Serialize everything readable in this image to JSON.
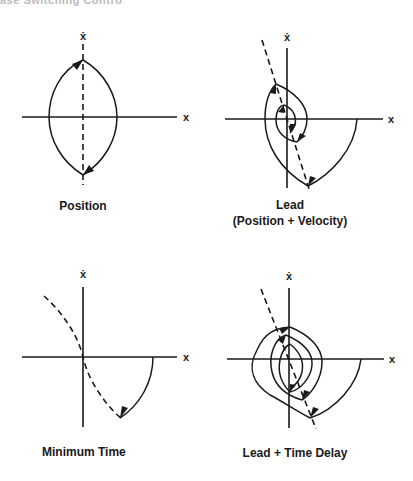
{
  "header": {
    "cut_text": "ase Switching Contro"
  },
  "panels": [
    {
      "id": "position",
      "title": "Position",
      "x_label": "x",
      "y_label": "ẋ",
      "switching_line": "vertical dashed (x = 0)"
    },
    {
      "id": "lead",
      "title": "Lead",
      "subtitle": "(Position + Velocity)",
      "x_label": "x",
      "y_label": "ẋ",
      "switching_line": "tilted dashed line"
    },
    {
      "id": "minimum-time",
      "title": "Minimum Time",
      "x_label": "x",
      "y_label": "ẋ",
      "switching_line": "parabolic dashed curve"
    },
    {
      "id": "lead-time-delay",
      "title": "Lead + Time Delay",
      "x_label": "x",
      "y_label": "ẋ",
      "switching_line": "tilted dashed line"
    }
  ],
  "colors": {
    "ink": "#1a1a1a",
    "background": "#ffffff"
  }
}
